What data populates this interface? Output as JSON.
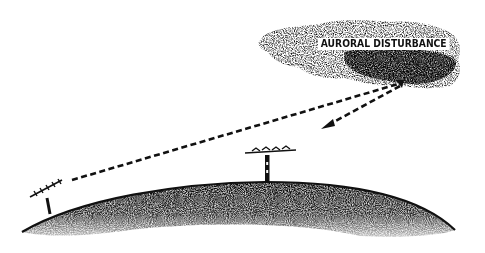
{
  "diagram": {
    "type": "illustration",
    "cloud": {
      "label": "AURORAL DISTURBANCE",
      "color": "#2a2a2a"
    },
    "earth": {
      "color": "#222222"
    },
    "antennas": [
      {
        "name": "left-antenna"
      },
      {
        "name": "right-antenna"
      }
    ],
    "paths": [
      {
        "name": "incident-path",
        "from": "left-antenna",
        "to": "auroral-disturbance"
      },
      {
        "name": "reflected-path",
        "from": "auroral-disturbance",
        "to": "right-antenna"
      }
    ],
    "colors": {
      "ink": "#111111",
      "background": "#ffffff"
    }
  }
}
